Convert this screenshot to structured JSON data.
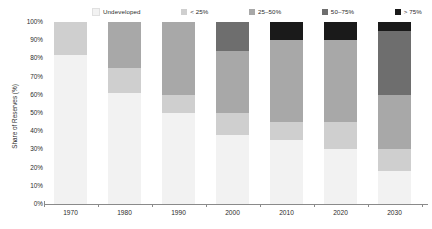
{
  "chart_data": {
    "type": "bar",
    "subtype": "stacked-bar-100-percent",
    "title": "",
    "xlabel": "",
    "ylabel": "Share of Reserves (%)",
    "ylim": [
      0,
      100
    ],
    "yticks": [
      "0%",
      "10%",
      "20%",
      "30%",
      "40%",
      "50%",
      "60%",
      "70%",
      "80%",
      "90%",
      "100%"
    ],
    "ytick_values": [
      0,
      10,
      20,
      30,
      40,
      50,
      60,
      70,
      80,
      90,
      100
    ],
    "grid": false,
    "legend_position": "top",
    "categories": [
      "1970",
      "1980",
      "1990",
      "2000",
      "2010",
      "2020",
      "2030"
    ],
    "series": [
      {
        "name": "Undeveloped",
        "color": "#f2f2f2",
        "values": [
          82,
          61,
          50,
          38,
          35,
          30,
          18
        ]
      },
      {
        "name": "< 25%",
        "color": "#cfcfcf",
        "values": [
          18,
          14,
          10,
          12,
          10,
          15,
          12
        ]
      },
      {
        "name": "25–50%",
        "color": "#a8a8a8",
        "values": [
          0,
          25,
          40,
          34,
          45,
          45,
          30
        ]
      },
      {
        "name": "50–75%",
        "color": "#6e6e6e",
        "values": [
          0,
          0,
          0,
          16,
          0,
          0,
          35
        ]
      },
      {
        "name": "> 75%",
        "color": "#1a1a1a",
        "values": [
          0,
          0,
          0,
          0,
          10,
          10,
          5
        ]
      }
    ]
  },
  "legend": {
    "items": [
      {
        "label": "Undeveloped",
        "color": "#f2f2f2"
      },
      {
        "label": "< 25%",
        "color": "#cfcfcf"
      },
      {
        "label": "25–50%",
        "color": "#a8a8a8"
      },
      {
        "label": "50–75%",
        "color": "#6e6e6e"
      },
      {
        "label": "> 75%",
        "color": "#1a1a1a"
      }
    ]
  },
  "axis": {
    "y_title": "Share of Reserves (%)",
    "y_ticks": [
      "100%",
      "90%",
      "80%",
      "70%",
      "60%",
      "50%",
      "40%",
      "30%",
      "20%",
      "10%",
      "0%"
    ],
    "x_ticks": [
      "1970",
      "1980",
      "1990",
      "2000",
      "2010",
      "2020",
      "2030"
    ]
  },
  "colors": {
    "axis": "#8a8a8a",
    "text": "#2b2b2b",
    "background": "#ffffff"
  }
}
